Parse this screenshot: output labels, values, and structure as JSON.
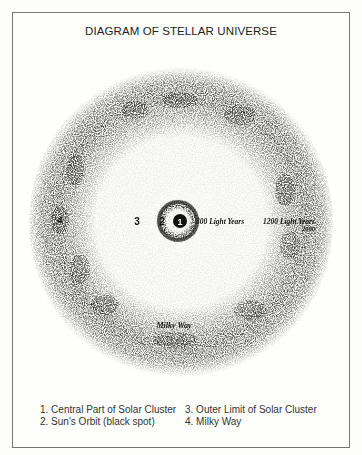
{
  "title": "DIAGRAM OF STELLAR UNIVERSE",
  "diagram": {
    "markers": {
      "m1": "1",
      "m2": "2",
      "m3": "3",
      "m4": "4"
    },
    "labels": {
      "inner_distance": "300 Light Years",
      "outer_distance": "1200 Light Years",
      "outer_distance_sub": "2000",
      "milky_way": "Milky Way"
    }
  },
  "legend": {
    "items": [
      "1.  Central Part of Solar Cluster",
      "2.  Sun's Orbit (black spot)",
      "3.  Outer Limit of Solar Cluster",
      "4.  Milky Way"
    ]
  }
}
